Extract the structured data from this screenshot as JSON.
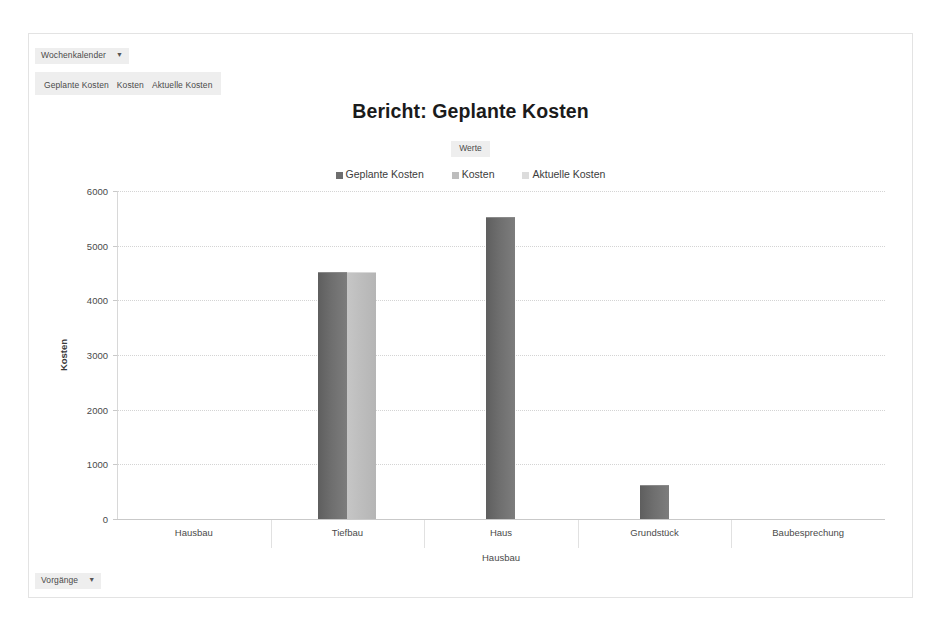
{
  "report": {
    "title": "Bericht: Geplante Kosten",
    "top_filter": {
      "label": "Wochenkalender",
      "caret": "▼"
    },
    "bottom_filter": {
      "label": "Vorgänge",
      "caret": "▼"
    },
    "field_chips": [
      "Geplante Kosten",
      "Kosten",
      "Aktuelle Kosten"
    ],
    "legend_heading": "Werte"
  },
  "chart_data": {
    "type": "bar",
    "title": "Bericht: Geplante Kosten",
    "xlabel": "Hausbau",
    "ylabel": "Kosten",
    "categories": [
      "Hausbau",
      "Tiefbau",
      "Haus",
      "Grundstück",
      "Baubesprechung"
    ],
    "series": [
      {
        "name": "Geplante Kosten",
        "color": "#6e6e6e",
        "values": [
          0,
          4500,
          5500,
          600,
          0
        ]
      },
      {
        "name": "Kosten",
        "color": "#bdbdbd",
        "values": [
          0,
          4500,
          0,
          0,
          0
        ]
      },
      {
        "name": "Aktuelle Kosten",
        "color": "#dcdcdc",
        "values": [
          0,
          0,
          0,
          0,
          0
        ]
      }
    ],
    "ylim": [
      0,
      6000
    ],
    "yticks": [
      0,
      1000,
      2000,
      3000,
      4000,
      5000,
      6000
    ],
    "ytick_labels": [
      "0",
      "1000",
      "2000",
      "3000",
      "4000",
      "5000",
      "6000"
    ],
    "grid": true,
    "legend_position": "top-center"
  }
}
